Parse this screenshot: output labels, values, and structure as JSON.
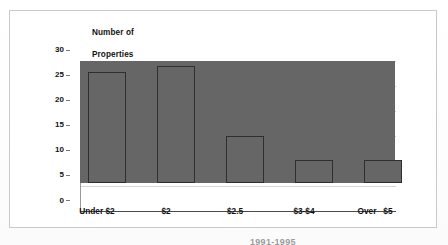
{
  "chart_data": {
    "type": "bar",
    "title": "Number of\nProperties",
    "title_line1": "Number of",
    "title_line2": "Properties",
    "xlabel": "",
    "ylabel": "Number of Properties",
    "categories": [
      "Under $2",
      "$2",
      "$2.5",
      "$3-$4",
      "Over   $5"
    ],
    "values": [
      24.3,
      22.1,
      23.3,
      9.3,
      4.6
    ],
    "yticks": [
      "0",
      "5",
      "10",
      "15",
      "20",
      "25",
      "30"
    ],
    "ytick_values": [
      0,
      5,
      10,
      15,
      20,
      25,
      30
    ],
    "ylim": [
      0,
      30
    ],
    "grid": "horizontal",
    "legend": "none",
    "bar_color": "#666666",
    "bar_border_color": "#2f2f2f",
    "gridline_color": "#d4d4d4",
    "axis_color": "#4a4a4a",
    "frame_color": "#c9c9c9",
    "background": "#ffffff"
  },
  "caption": {
    "partial_text": "1991-1995"
  }
}
